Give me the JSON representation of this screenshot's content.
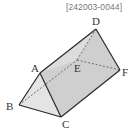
{
  "problem_code": "[242003-0044]",
  "figure": {
    "type": "triangular prism",
    "vertices": [
      "A",
      "B",
      "C",
      "D",
      "E",
      "F"
    ],
    "labels": {
      "A": "A",
      "B": "B",
      "C": "C",
      "D": "D",
      "E": "E",
      "F": "F"
    },
    "visible_edges": [
      "AB",
      "AC",
      "BC",
      "AD",
      "CF",
      "DF"
    ],
    "hidden_edges": [
      "BE",
      "DE",
      "EF"
    ],
    "colors": {
      "edge": "#333333",
      "face_light": "#e6e6e6",
      "face_mid": "#d2d2d2",
      "face_dark": "#c4c4c4"
    }
  }
}
